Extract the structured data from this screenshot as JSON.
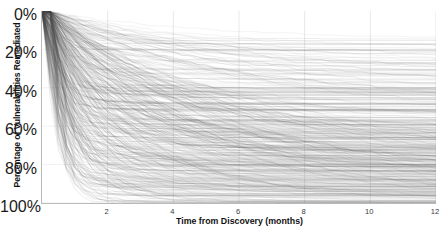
{
  "chart_data": {
    "type": "line",
    "title": "",
    "xlabel": "Time from Discovery (months)",
    "ylabel": "Percentage of Vulnerabilities Remediated",
    "xlim": [
      0,
      12
    ],
    "ylim": [
      0,
      100
    ],
    "y_inverted": true,
    "grid": true,
    "legend": "none",
    "xticks": [
      2,
      4,
      6,
      8,
      10,
      12
    ],
    "xtick_labels": [
      "2",
      "4",
      "6",
      "8",
      "10",
      "12"
    ],
    "yticks": [
      0,
      20,
      40,
      60,
      80,
      100
    ],
    "ytick_labels": [
      "0%",
      "20%",
      "40%",
      "60%",
      "80%",
      "100%"
    ],
    "series_count": 420,
    "line_color": "#555555",
    "line_opacity": 0.18,
    "line_width": 0.5,
    "series_summary": [
      {
        "name": "fast-remediators",
        "approx_fraction": 0.18,
        "value_at_12_months": 95
      },
      {
        "name": "above-median",
        "approx_fraction": 0.22,
        "value_at_12_months": 82
      },
      {
        "name": "median-band",
        "approx_fraction": 0.25,
        "value_at_12_months": 68
      },
      {
        "name": "slow-remediators",
        "approx_fraction": 0.2,
        "value_at_12_months": 45
      },
      {
        "name": "stalled",
        "approx_fraction": 0.15,
        "value_at_12_months": 22
      }
    ],
    "x": [
      0,
      0.25,
      0.5,
      1,
      2,
      3,
      4,
      5,
      6,
      7,
      8,
      9,
      10,
      11,
      12
    ],
    "envelope_upper_percent_remediated": [
      0,
      22,
      38,
      55,
      72,
      81,
      86,
      90,
      92,
      94,
      95,
      96,
      97,
      98,
      99
    ],
    "envelope_median_percent_remediated": [
      0,
      6,
      11,
      18,
      29,
      37,
      44,
      49,
      54,
      58,
      62,
      65,
      68,
      70,
      72
    ],
    "envelope_lower_percent_remediated": [
      0,
      0,
      1,
      2,
      4,
      6,
      8,
      10,
      12,
      14,
      16,
      18,
      20,
      22,
      24
    ]
  },
  "axes": {
    "x_title": "Time from Discovery (months)",
    "y_title": "Percentage of Vulnerabilities Remediated"
  }
}
